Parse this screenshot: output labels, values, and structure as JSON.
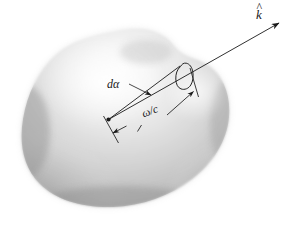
{
  "figure": {
    "kind": "physics-diagram",
    "background_color": "#ffffff",
    "ink_color": "#1a1a1a",
    "blob": {
      "name": "radiating-volume",
      "fill_light": "#f2f2f2",
      "fill_mid": "#d2d2d2",
      "fill_dark": "#9a9a9a",
      "edge_shadow": "#8c8c8c"
    },
    "labels": {
      "k_hat": {
        "base": "k",
        "accent": "^",
        "text": "k̂"
      },
      "d_alpha": {
        "text": "dα"
      },
      "omega_over_c": {
        "numerator": "ω",
        "slash": "/",
        "denominator": "c",
        "text": "ω/c"
      }
    },
    "annotations": {
      "ray_label": "k̂",
      "angle_label": "dα",
      "length_label": "ω/c"
    }
  }
}
